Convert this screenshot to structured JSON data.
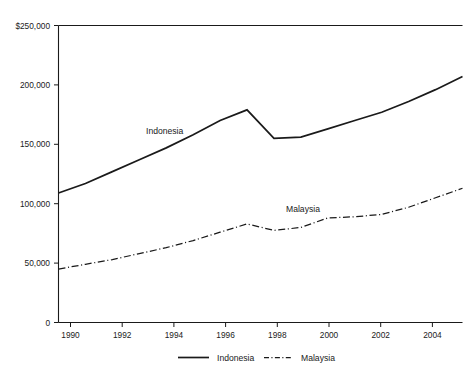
{
  "chart_data": {
    "type": "line",
    "title": "",
    "subtitle": "",
    "xlabel": "",
    "ylabel": "",
    "xlim": [
      1990,
      2005
    ],
    "ylim": [
      0,
      250000
    ],
    "grid": false,
    "legend_position": "bottom-center",
    "x": [
      1990,
      1991,
      1992,
      1993,
      1994,
      1995,
      1996,
      1997,
      1998,
      1999,
      2000,
      2001,
      2002,
      2003,
      2004,
      2005
    ],
    "y_ticks": [
      0,
      50000,
      100000,
      150000,
      200000,
      250000
    ],
    "y_tick_labels": [
      "0",
      "50,000",
      "100,000",
      "150,000",
      "200,000",
      "$250,000"
    ],
    "x_ticks": [
      1990,
      1992,
      1994,
      1996,
      1998,
      2000,
      2002,
      2004
    ],
    "x_tick_labels": [
      "1990",
      "1992",
      "1994",
      "1996",
      "1998",
      "2000",
      "2002",
      "2004"
    ],
    "series": [
      {
        "name": "Indonesia",
        "style": "solid",
        "color": "#1a1a1a",
        "inline_label": "Indonesia",
        "values": [
          109000,
          117000,
          127000,
          137000,
          147000,
          158000,
          170000,
          179000,
          155000,
          156000,
          163000,
          170000,
          177000,
          186000,
          196000,
          207000
        ]
      },
      {
        "name": "Malaysia",
        "style": "dash-dot",
        "color": "#1a1a1a",
        "inline_label": "Malaysia",
        "values": [
          45000,
          49000,
          53000,
          58000,
          63000,
          69000,
          76000,
          83000,
          77500,
          80000,
          88000,
          89000,
          91000,
          97000,
          105000,
          113000
        ]
      }
    ],
    "legend": [
      {
        "label": "Indonesia",
        "style": "solid"
      },
      {
        "label": "Malaysia",
        "style": "dash-dot"
      }
    ]
  }
}
